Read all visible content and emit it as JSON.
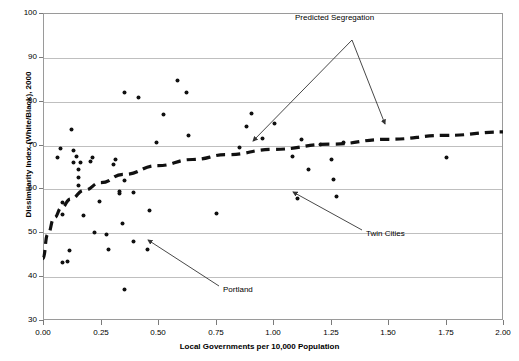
{
  "chart_data": {
    "type": "scatter",
    "title": "",
    "xlabel": "Local Governments per 10,000 Population",
    "ylabel": "Dissimilarity Index (White/Black), 2000",
    "xlim": [
      0.0,
      2.0
    ],
    "ylim": [
      30,
      100
    ],
    "xticks": [
      "0.00",
      "0.25",
      "0.50",
      "0.75",
      "1.00",
      "1.25",
      "1.50",
      "1.75",
      "2.00"
    ],
    "xtick_values": [
      0.0,
      0.25,
      0.5,
      0.75,
      1.0,
      1.25,
      1.5,
      1.75,
      2.0
    ],
    "yticks": [
      "30",
      "40",
      "50",
      "60",
      "70",
      "80",
      "90",
      "100"
    ],
    "ytick_values": [
      30,
      40,
      50,
      60,
      70,
      80,
      90,
      100
    ],
    "grid": "horizontal",
    "legend": "none",
    "series": [
      {
        "name": "Metropolitan areas",
        "marker": "dot",
        "color": "#111111",
        "points": [
          [
            0.06,
            67.4
          ],
          [
            0.07,
            69.3
          ],
          [
            0.08,
            57.0
          ],
          [
            0.08,
            54.2
          ],
          [
            0.08,
            43.4
          ],
          [
            0.1,
            43.6
          ],
          [
            0.11,
            46.2
          ],
          [
            0.12,
            73.6
          ],
          [
            0.13,
            68.8
          ],
          [
            0.13,
            66.2
          ],
          [
            0.14,
            67.5
          ],
          [
            0.15,
            64.5
          ],
          [
            0.15,
            62.8
          ],
          [
            0.15,
            60.8
          ],
          [
            0.16,
            66.1
          ],
          [
            0.17,
            54.0
          ],
          [
            0.2,
            66.3
          ],
          [
            0.21,
            67.4
          ],
          [
            0.22,
            50.3
          ],
          [
            0.24,
            57.2
          ],
          [
            0.27,
            49.7
          ],
          [
            0.28,
            46.3
          ],
          [
            0.3,
            65.6
          ],
          [
            0.31,
            66.9
          ],
          [
            0.33,
            59.5
          ],
          [
            0.33,
            59.1
          ],
          [
            0.34,
            52.3
          ],
          [
            0.35,
            62.1
          ],
          [
            0.35,
            82.0
          ],
          [
            0.35,
            37.1
          ],
          [
            0.39,
            59.2
          ],
          [
            0.39,
            48.1
          ],
          [
            0.41,
            81.0
          ],
          [
            0.45,
            46.4
          ],
          [
            0.46,
            55.2
          ],
          [
            0.49,
            70.7
          ],
          [
            0.52,
            77.0
          ],
          [
            0.58,
            84.8
          ],
          [
            0.62,
            82.2
          ],
          [
            0.63,
            72.4
          ],
          [
            0.75,
            54.5
          ],
          [
            0.85,
            69.5
          ],
          [
            0.88,
            74.4
          ],
          [
            0.9,
            77.4
          ],
          [
            0.95,
            71.6
          ],
          [
            1.0,
            75.0
          ],
          [
            1.08,
            67.5
          ],
          [
            1.1,
            58.0
          ],
          [
            1.12,
            71.5
          ],
          [
            1.15,
            64.5
          ],
          [
            1.2,
            70.2
          ],
          [
            1.25,
            66.8
          ],
          [
            1.26,
            62.2
          ],
          [
            1.27,
            58.5
          ],
          [
            1.3,
            70.8
          ],
          [
            1.75,
            67.3
          ]
        ]
      }
    ],
    "trendline": {
      "name": "Predicted Segregation",
      "style": "dashed",
      "color": "#111111",
      "points": [
        [
          0.0,
          44.0
        ],
        [
          0.02,
          49.5
        ],
        [
          0.05,
          53.4
        ],
        [
          0.08,
          55.6
        ],
        [
          0.12,
          57.6
        ],
        [
          0.18,
          59.6
        ],
        [
          0.25,
          61.3
        ],
        [
          0.35,
          63.2
        ],
        [
          0.5,
          65.2
        ],
        [
          0.65,
          66.6
        ],
        [
          0.8,
          67.7
        ],
        [
          1.0,
          68.9
        ],
        [
          1.25,
          70.1
        ],
        [
          1.5,
          71.2
        ],
        [
          1.75,
          72.1
        ],
        [
          2.0,
          72.9
        ]
      ]
    },
    "annotations": [
      {
        "id": "predicted-segregation",
        "text": "Predicted Segregation",
        "label_x": 295,
        "label_y": 13,
        "arrows": [
          {
            "from": [
              352,
              40
            ],
            "to": [
              253,
              141
            ]
          },
          {
            "from": [
              352,
              40
            ],
            "to": [
              385,
              124
            ]
          }
        ]
      },
      {
        "id": "twin-cities",
        "text": "Twin Cities",
        "label_x": 366,
        "label_y": 229,
        "arrows": [
          {
            "from": [
              362,
              230
            ],
            "to": [
              293,
              192
            ]
          }
        ]
      },
      {
        "id": "portland",
        "text": "Portland",
        "label_x": 223,
        "label_y": 285,
        "arrows": [
          {
            "from": [
              219,
              286
            ],
            "to": [
              148,
              240
            ]
          }
        ]
      }
    ]
  }
}
